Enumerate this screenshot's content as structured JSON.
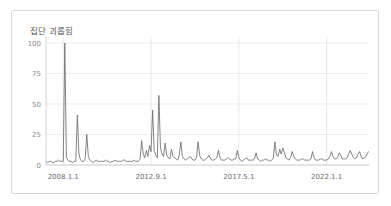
{
  "card": {
    "border_color": "#d8d8d8",
    "background": "#ffffff"
  },
  "chart_data": {
    "type": "line",
    "title": "집단 괴롭힘",
    "subtitle": "",
    "xlabel": "",
    "ylabel": "",
    "ylim": [
      0,
      100
    ],
    "xlim": [
      0,
      209
    ],
    "grid": true,
    "legend": null,
    "legend_position": "none",
    "line_color": "#6e6e6e",
    "grid_color": "#e6e6e6",
    "axis_color": "#c9c9c9",
    "tick_label_color": "#8a8a8a",
    "y_ticks": [
      0,
      25,
      50,
      75,
      100
    ],
    "y_tick_labels": [
      "0",
      "25",
      "50",
      "75",
      "100"
    ],
    "x_ticks": [
      11,
      67,
      123,
      179
    ],
    "x_tick_labels": [
      "2008.1.1",
      "2012.9.1",
      "2017.5.1",
      "2022.1.1"
    ],
    "x_unit": "month index from 2007-02",
    "series": [
      {
        "name": "집단 괴롭힘",
        "color": "#6e6e6e",
        "values": [
          3,
          2,
          3,
          3,
          2,
          2,
          3,
          3,
          4,
          3,
          3,
          3,
          100,
          6,
          4,
          3,
          3,
          2,
          3,
          3,
          41,
          9,
          4,
          3,
          3,
          5,
          25,
          7,
          4,
          3,
          2,
          3,
          4,
          3,
          3,
          3,
          3,
          3,
          4,
          3,
          3,
          2,
          3,
          3,
          4,
          3,
          3,
          3,
          3,
          4,
          4,
          3,
          3,
          3,
          3,
          3,
          4,
          3,
          3,
          3,
          5,
          20,
          9,
          6,
          12,
          7,
          16,
          11,
          45,
          12,
          8,
          6,
          57,
          14,
          9,
          7,
          18,
          8,
          6,
          5,
          13,
          7,
          6,
          5,
          4,
          8,
          19,
          7,
          5,
          4,
          5,
          6,
          7,
          5,
          4,
          4,
          6,
          19,
          8,
          5,
          4,
          4,
          5,
          6,
          8,
          5,
          4,
          4,
          5,
          6,
          12,
          6,
          4,
          4,
          4,
          5,
          6,
          5,
          4,
          4,
          5,
          5,
          12,
          6,
          4,
          3,
          4,
          5,
          6,
          4,
          4,
          4,
          4,
          5,
          10,
          5,
          4,
          3,
          4,
          4,
          5,
          4,
          4,
          3,
          4,
          6,
          19,
          8,
          7,
          13,
          9,
          14,
          10,
          6,
          5,
          4,
          6,
          11,
          7,
          5,
          4,
          4,
          4,
          5,
          5,
          4,
          4,
          4,
          4,
          5,
          11,
          6,
          4,
          4,
          4,
          5,
          5,
          4,
          4,
          4,
          5,
          7,
          11,
          7,
          5,
          5,
          6,
          10,
          8,
          5,
          5,
          5,
          6,
          9,
          12,
          9,
          6,
          5,
          6,
          9,
          11,
          7,
          5,
          6,
          7,
          10,
          11
        ]
      }
    ]
  }
}
